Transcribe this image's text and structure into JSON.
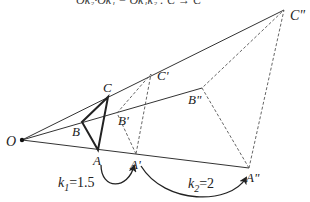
{
  "figure": {
    "clipped_caption": "Ok₂·Ok₁ = Ok₁k₂ : C → C",
    "center": {
      "label": "O",
      "x": 22,
      "y": 140
    },
    "original": {
      "A": {
        "label": "A",
        "x": 98,
        "y": 150
      },
      "B": {
        "label": "B",
        "x": 82,
        "y": 122
      },
      "C": {
        "label": "C",
        "x": 108,
        "y": 97
      }
    },
    "first_image": {
      "A": {
        "label": "A'",
        "x": 136,
        "y": 154
      },
      "B": {
        "label": "B'",
        "x": 117,
        "y": 113
      },
      "C": {
        "label": "C'",
        "x": 151,
        "y": 74
      }
    },
    "second_image": {
      "A": {
        "label": "A\"",
        "x": 249,
        "y": 168
      },
      "B": {
        "label": "B\"",
        "x": 202,
        "y": 88
      },
      "C": {
        "label": "C\"",
        "x": 284,
        "y": 10
      }
    },
    "transforms": [
      {
        "label_k": "k",
        "sub": "1",
        "value": "=1.5"
      },
      {
        "label_k": "k",
        "sub": "2",
        "value": "=2"
      }
    ]
  }
}
